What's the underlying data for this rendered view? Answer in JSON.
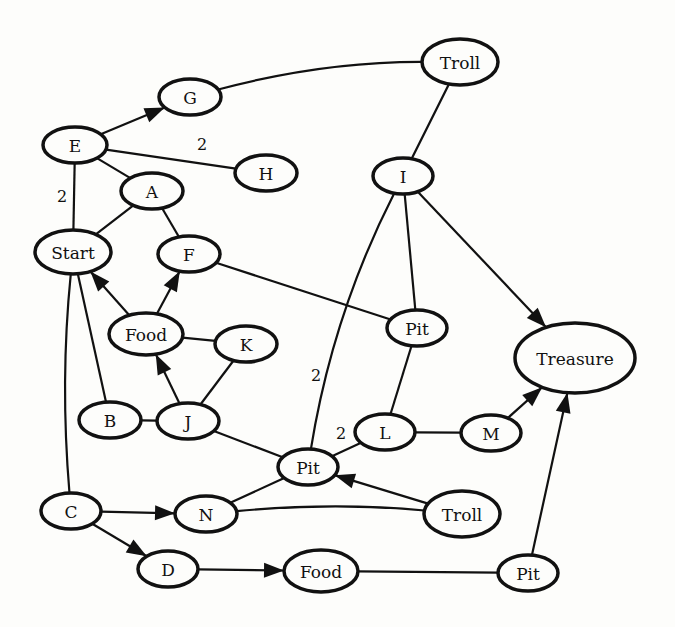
{
  "diagram": {
    "type": "directed-weighted-graph",
    "nodes": [
      {
        "id": "E",
        "label": "E",
        "x": 75,
        "y": 145,
        "rx": 32,
        "ry": 18
      },
      {
        "id": "G",
        "label": "G",
        "x": 190,
        "y": 97,
        "rx": 31,
        "ry": 18
      },
      {
        "id": "H",
        "label": "H",
        "x": 266,
        "y": 173,
        "rx": 31,
        "ry": 18
      },
      {
        "id": "A",
        "label": "A",
        "x": 152,
        "y": 191,
        "rx": 31,
        "ry": 18
      },
      {
        "id": "Start",
        "label": "Start",
        "x": 73,
        "y": 252,
        "rx": 38,
        "ry": 22
      },
      {
        "id": "F",
        "label": "F",
        "x": 189,
        "y": 254,
        "rx": 31,
        "ry": 18
      },
      {
        "id": "Food1",
        "label": "Food",
        "x": 146,
        "y": 334,
        "rx": 37,
        "ry": 21
      },
      {
        "id": "K",
        "label": "K",
        "x": 246,
        "y": 344,
        "rx": 31,
        "ry": 18
      },
      {
        "id": "B",
        "label": "B",
        "x": 110,
        "y": 420,
        "rx": 31,
        "ry": 18
      },
      {
        "id": "J",
        "label": "J",
        "x": 188,
        "y": 421,
        "rx": 31,
        "ry": 18
      },
      {
        "id": "Troll1",
        "label": "Troll",
        "x": 460,
        "y": 62,
        "rx": 38,
        "ry": 23
      },
      {
        "id": "I",
        "label": "I",
        "x": 403,
        "y": 176,
        "rx": 30,
        "ry": 18
      },
      {
        "id": "Pit1",
        "label": "Pit",
        "x": 417,
        "y": 328,
        "rx": 30,
        "ry": 18
      },
      {
        "id": "Treasure",
        "label": "Treasure",
        "x": 575,
        "y": 358,
        "rx": 60,
        "ry": 35
      },
      {
        "id": "L",
        "label": "L",
        "x": 385,
        "y": 432,
        "rx": 30,
        "ry": 18
      },
      {
        "id": "M",
        "label": "M",
        "x": 491,
        "y": 433,
        "rx": 30,
        "ry": 18
      },
      {
        "id": "Pit2",
        "label": "Pit",
        "x": 308,
        "y": 467,
        "rx": 30,
        "ry": 18
      },
      {
        "id": "C",
        "label": "C",
        "x": 71,
        "y": 511,
        "rx": 30,
        "ry": 18
      },
      {
        "id": "N",
        "label": "N",
        "x": 206,
        "y": 514,
        "rx": 31,
        "ry": 18
      },
      {
        "id": "Troll2",
        "label": "Troll",
        "x": 462,
        "y": 514,
        "rx": 38,
        "ry": 23
      },
      {
        "id": "D",
        "label": "D",
        "x": 168,
        "y": 569,
        "rx": 30,
        "ry": 18
      },
      {
        "id": "Food2",
        "label": "Food",
        "x": 321,
        "y": 571,
        "rx": 37,
        "ry": 21
      },
      {
        "id": "Pit3",
        "label": "Pit",
        "x": 528,
        "y": 573,
        "rx": 30,
        "ry": 18
      }
    ],
    "edges": [
      {
        "from": "E",
        "to": "G",
        "directed": true,
        "weight": ""
      },
      {
        "from": "E",
        "to": "H",
        "directed": false,
        "weight": "2",
        "wx": 202,
        "wy": 144
      },
      {
        "from": "E",
        "to": "A",
        "directed": false,
        "weight": ""
      },
      {
        "from": "E",
        "to": "Start",
        "directed": false,
        "weight": "2",
        "wx": 62,
        "wy": 196
      },
      {
        "from": "G",
        "to": "Troll1",
        "directed": false,
        "weight": "",
        "curve": -6
      },
      {
        "from": "A",
        "to": "Start",
        "directed": false,
        "weight": ""
      },
      {
        "from": "A",
        "to": "F",
        "directed": false,
        "weight": ""
      },
      {
        "from": "Food1",
        "to": "Start",
        "directed": true,
        "weight": ""
      },
      {
        "from": "Food1",
        "to": "F",
        "directed": true,
        "weight": ""
      },
      {
        "from": "F",
        "to": "Pit1",
        "directed": false,
        "weight": ""
      },
      {
        "from": "Food1",
        "to": "K",
        "directed": false,
        "weight": ""
      },
      {
        "from": "J",
        "to": "Food1",
        "directed": true,
        "weight": ""
      },
      {
        "from": "J",
        "to": "K",
        "directed": false,
        "weight": ""
      },
      {
        "from": "B",
        "to": "J",
        "directed": false,
        "weight": ""
      },
      {
        "from": "Start",
        "to": "B",
        "directed": false,
        "weight": ""
      },
      {
        "from": "Start",
        "to": "C",
        "directed": false,
        "weight": "",
        "curve": 4
      },
      {
        "from": "J",
        "to": "Pit2",
        "directed": false,
        "weight": ""
      },
      {
        "from": "Troll1",
        "to": "I",
        "directed": false,
        "weight": ""
      },
      {
        "from": "I",
        "to": "Pit1",
        "directed": false,
        "weight": ""
      },
      {
        "from": "I",
        "to": "Treasure",
        "directed": true,
        "weight": ""
      },
      {
        "from": "I",
        "to": "Pit2",
        "directed": false,
        "weight": "2",
        "wx": 316,
        "wy": 375,
        "curve": 8
      },
      {
        "from": "Pit1",
        "to": "L",
        "directed": false,
        "weight": ""
      },
      {
        "from": "L",
        "to": "Pit2",
        "directed": false,
        "weight": "2",
        "wx": 341,
        "wy": 433
      },
      {
        "from": "L",
        "to": "M",
        "directed": false,
        "weight": ""
      },
      {
        "from": "M",
        "to": "Treasure",
        "directed": true,
        "weight": ""
      },
      {
        "from": "Troll2",
        "to": "Pit2",
        "directed": true,
        "weight": ""
      },
      {
        "from": "N",
        "to": "Pit2",
        "directed": false,
        "weight": ""
      },
      {
        "from": "N",
        "to": "Troll2",
        "directed": false,
        "weight": "",
        "curve": -4
      },
      {
        "from": "C",
        "to": "N",
        "directed": true,
        "weight": ""
      },
      {
        "from": "C",
        "to": "D",
        "directed": true,
        "weight": ""
      },
      {
        "from": "D",
        "to": "Food2",
        "directed": true,
        "weight": ""
      },
      {
        "from": "Food2",
        "to": "Pit3",
        "directed": false,
        "weight": ""
      },
      {
        "from": "Pit3",
        "to": "Treasure",
        "directed": true,
        "weight": ""
      }
    ]
  }
}
